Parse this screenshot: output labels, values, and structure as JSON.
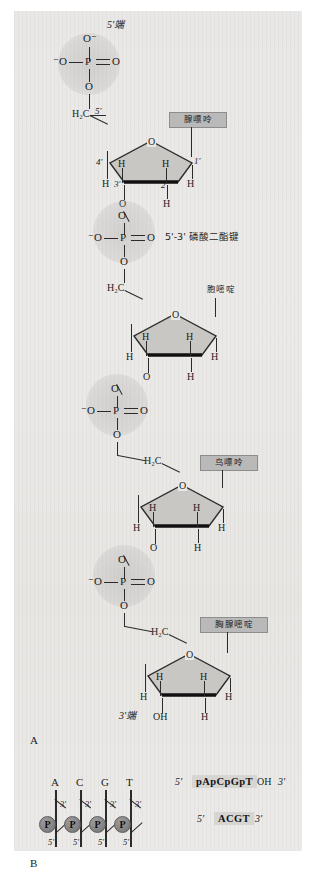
{
  "figure": {
    "title_caption": "",
    "panel_a_label": "A",
    "panel_b_label": "B",
    "end_5_label": "5'端",
    "end_3_label": "3'端",
    "phosphodiester_label": "5'-3' 磷酸二酯键"
  },
  "atoms": {
    "O": "O",
    "O_minus": "⁻O",
    "O_minus_top": "O⁻",
    "P": "P",
    "H": "H",
    "OH": "OH",
    "H2C": "H₂C",
    "C5prime": "5'",
    "C4prime": "4'",
    "C3prime": "3'",
    "C2prime": "2'",
    "C1prime": "1'"
  },
  "bases": [
    {
      "id": "adenine",
      "label": "腺嘌呤",
      "letter": "A"
    },
    {
      "id": "cytosine",
      "label": "胞嘧啶",
      "letter": "C"
    },
    {
      "id": "guanine",
      "label": "鸟嘌呤",
      "letter": "G"
    },
    {
      "id": "thymine",
      "label": "胸腺嘧啶",
      "letter": "T"
    }
  ],
  "nucleotide_units": [
    {
      "index": 1,
      "base": "腺嘌呤",
      "phosphate_top_o": "O⁻",
      "phosphate_left_o": "⁻O",
      "phosphate_right_o": "O",
      "phosphate_bottom_o": "O",
      "ring_o": "O",
      "ring_positions": [
        "4'",
        "3'",
        "2'",
        "1'"
      ],
      "ring_h": [
        "H",
        "H",
        "H",
        "H",
        "H"
      ],
      "c5_group": "H₂C",
      "c5_label": "5'"
    },
    {
      "index": 2,
      "base": "胞嘧啶",
      "phosphate_top_o": "O",
      "phosphate_left_o": "⁻O",
      "phosphate_right_o": "O",
      "phosphate_bottom_o": "O",
      "ring_o": "O",
      "ring_h": [
        "H",
        "H",
        "H",
        "H",
        "H"
      ],
      "c5_group": "H₂C"
    },
    {
      "index": 3,
      "base": "鸟嘌呤",
      "phosphate_top_o": "O",
      "phosphate_left_o": "⁻O",
      "phosphate_right_o": "O",
      "phosphate_bottom_o": "O",
      "ring_o": "O",
      "ring_h": [
        "H",
        "H",
        "H",
        "H",
        "H"
      ],
      "c5_group": "H₂C"
    },
    {
      "index": 4,
      "base": "胸腺嘧啶",
      "phosphate_top_o": "O",
      "phosphate_left_o": "⁻O",
      "phosphate_right_o": "O",
      "phosphate_bottom_o": "O",
      "ring_o": "O",
      "ring_h": [
        "H",
        "H",
        "H",
        "H"
      ],
      "terminal_oh": "OH",
      "c5_group": "H₂C"
    }
  ],
  "panel_b": {
    "bases": [
      "A",
      "C",
      "G",
      "T"
    ],
    "phosphate_glyph": "P",
    "three_prime_marks": [
      "3'",
      "3'",
      "3'",
      "3'"
    ],
    "five_prime_marks": [
      "5'",
      "5'",
      "5'",
      "5'"
    ],
    "sequences": [
      {
        "left_end": "5'",
        "text": "pApCpGpT",
        "suffix": "OH",
        "right_end": "3'"
      },
      {
        "left_end": "5'",
        "text": "ACGT",
        "suffix": "",
        "right_end": "3'"
      }
    ]
  },
  "colors": {
    "background": "#e9e8e6",
    "bond": "#2b2b2b",
    "label_box": "#b9b9b9",
    "sugar_fill": "#c9c7c4",
    "phosphate_circle": "#868686"
  }
}
